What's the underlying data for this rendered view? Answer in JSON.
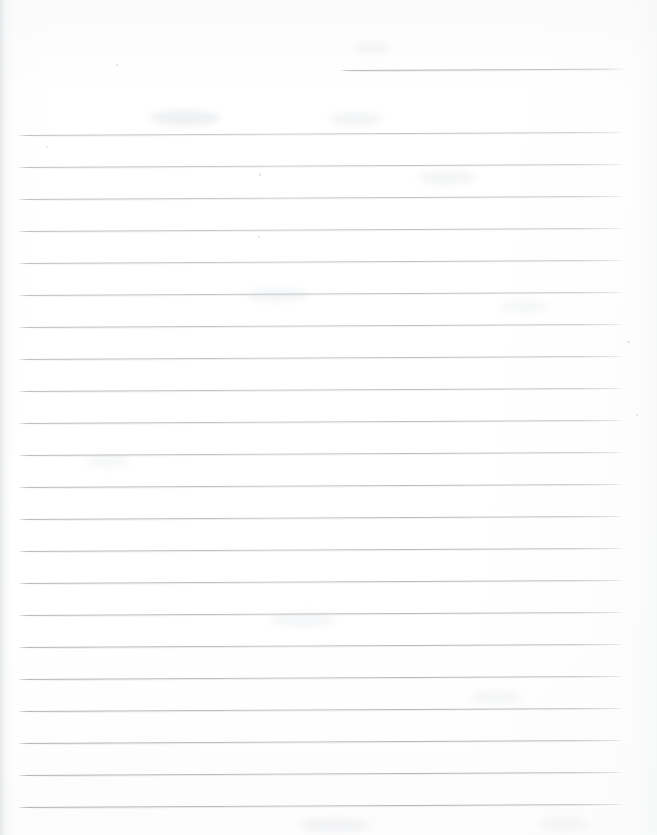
{
  "document": {
    "kind": "scanned-ruled-paper",
    "title": "Blank ruled notebook page (scan)",
    "page_width": 657,
    "page_height": 835,
    "background_color": "#fefefe",
    "rule_color": "#aeb4ba",
    "rule_thickness_px": 1,
    "body_text": "",
    "content_note": "No handwriting, printed text, headings or figures are present on this page."
  },
  "ruling": {
    "line_spacing_px": 32,
    "left_margin_x": 19,
    "right_margin_x": 622,
    "first_full_line_y": 135,
    "last_full_line_y": 807,
    "full_line_count": 22,
    "skew_degrees": -0.28,
    "partial_line": {
      "label": "top-right-partial-rule",
      "x_start": 340,
      "x_end": 624,
      "y": 70
    },
    "full_lines": [
      {
        "y": 135
      },
      {
        "y": 167
      },
      {
        "y": 199
      },
      {
        "y": 231
      },
      {
        "y": 263
      },
      {
        "y": 295
      },
      {
        "y": 327
      },
      {
        "y": 359
      },
      {
        "y": 391
      },
      {
        "y": 423
      },
      {
        "y": 455
      },
      {
        "y": 487
      },
      {
        "y": 519
      },
      {
        "y": 551
      },
      {
        "y": 583
      },
      {
        "y": 615
      },
      {
        "y": 647
      },
      {
        "y": 679
      },
      {
        "y": 711
      },
      {
        "y": 743
      },
      {
        "y": 775
      },
      {
        "y": 807
      }
    ]
  },
  "scan_artifacts": {
    "left_edge_shadow": true,
    "right_edge_shadow": true,
    "bleed_through_smudges": [
      {
        "x": 150,
        "y": 110,
        "w": 70,
        "h": 16,
        "opacity": 0.3
      },
      {
        "x": 330,
        "y": 112,
        "w": 52,
        "h": 14,
        "opacity": 0.22
      },
      {
        "x": 355,
        "y": 42,
        "w": 34,
        "h": 12,
        "opacity": 0.18
      },
      {
        "x": 418,
        "y": 170,
        "w": 58,
        "h": 15,
        "opacity": 0.2
      },
      {
        "x": 246,
        "y": 288,
        "w": 62,
        "h": 14,
        "opacity": 0.2
      },
      {
        "x": 500,
        "y": 300,
        "w": 48,
        "h": 13,
        "opacity": 0.16
      },
      {
        "x": 85,
        "y": 455,
        "w": 44,
        "h": 13,
        "opacity": 0.16
      },
      {
        "x": 270,
        "y": 612,
        "w": 66,
        "h": 15,
        "opacity": 0.18
      },
      {
        "x": 470,
        "y": 690,
        "w": 52,
        "h": 14,
        "opacity": 0.16
      },
      {
        "x": 300,
        "y": 818,
        "w": 70,
        "h": 14,
        "opacity": 0.2
      },
      {
        "x": 540,
        "y": 818,
        "w": 48,
        "h": 13,
        "opacity": 0.16
      }
    ],
    "specks": [
      {
        "x": 627,
        "y": 341,
        "w": 3,
        "h": 2
      },
      {
        "x": 258,
        "y": 236,
        "w": 2,
        "h": 2
      },
      {
        "x": 259,
        "y": 173,
        "w": 2,
        "h": 3
      },
      {
        "x": 46,
        "y": 146,
        "w": 2,
        "h": 2
      },
      {
        "x": 636,
        "y": 414,
        "w": 2,
        "h": 2
      },
      {
        "x": 116,
        "y": 64,
        "w": 2,
        "h": 2
      }
    ]
  }
}
